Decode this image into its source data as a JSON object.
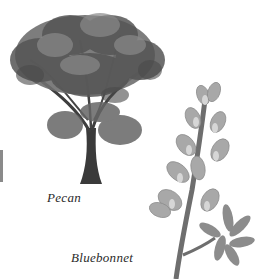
{
  "illustration": {
    "background": "#ffffff",
    "items": [
      {
        "id": "pecan",
        "label": "Pecan",
        "kind": "tree"
      },
      {
        "id": "bluebonnet",
        "label": "Bluebonnet",
        "kind": "flower"
      }
    ],
    "colors": {
      "foliage_dark": "#4a4a4a",
      "foliage_mid": "#777777",
      "foliage_light": "#9a9a9a",
      "trunk": "#3a3a3a",
      "petal": "#a8a8a8",
      "petal_light": "#d6d6d6",
      "stem": "#6e6e6e",
      "caption": "#2a2a2a"
    }
  }
}
